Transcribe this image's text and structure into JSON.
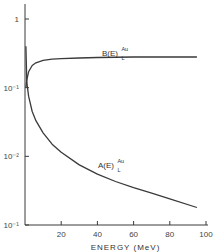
{
  "chart_data": {
    "type": "line",
    "title": "",
    "xlabel": "ENERGY (MeV)",
    "ylabel": "",
    "xlim": [
      0,
      100
    ],
    "ylim": [
      0.001,
      1
    ],
    "yscale": "log",
    "grid": false,
    "x_ticks": [
      "20",
      "40",
      "60",
      "80",
      "100"
    ],
    "y_ticks": [
      "1",
      "10⁻¹",
      "10⁻²",
      "10⁻¹"
    ],
    "series": [
      {
        "name": "B(E)_L^Au",
        "label_main": "B(E)",
        "label_sup": "Au",
        "label_sub": "L",
        "x": [
          0.5,
          1,
          2,
          4,
          6,
          10,
          15,
          20,
          30,
          40,
          60,
          80,
          95
        ],
        "values": [
          0.1,
          0.13,
          0.17,
          0.21,
          0.23,
          0.25,
          0.26,
          0.265,
          0.27,
          0.275,
          0.28,
          0.28,
          0.28
        ]
      },
      {
        "name": "A(E)_L^Au",
        "label_main": "A(E)",
        "label_sup": "Au",
        "label_sub": "L",
        "x": [
          0.5,
          1,
          2,
          4,
          6,
          10,
          15,
          20,
          30,
          40,
          50,
          60,
          70,
          80,
          95
        ],
        "values": [
          0.4,
          0.12,
          0.075,
          0.045,
          0.033,
          0.022,
          0.015,
          0.0115,
          0.0075,
          0.0055,
          0.0043,
          0.0035,
          0.0029,
          0.0024,
          0.0018
        ]
      }
    ]
  }
}
